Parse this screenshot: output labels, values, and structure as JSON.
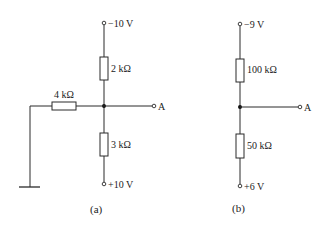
{
  "diagram": {
    "type": "circuit-schematic",
    "circuit_a": {
      "caption": "(a)",
      "top_supply": "−10 V",
      "bottom_supply": "+10 V",
      "upper_resistor": "2 kΩ",
      "lower_resistor": "3 kΩ",
      "side_resistor": "4 kΩ",
      "output_node": "A",
      "side_connection": "ground"
    },
    "circuit_b": {
      "caption": "(b)",
      "top_supply": "−9 V",
      "bottom_supply": "+6 V",
      "upper_resistor": "100 kΩ",
      "lower_resistor": "50 kΩ",
      "output_node": "A"
    }
  }
}
